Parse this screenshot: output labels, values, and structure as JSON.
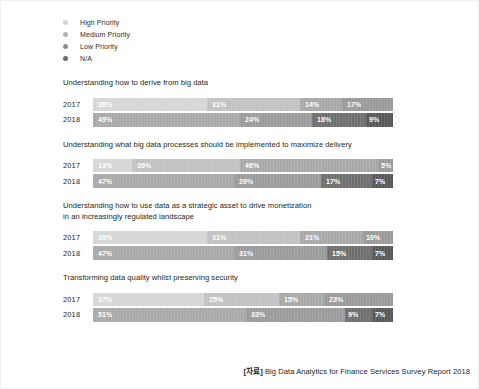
{
  "legend": {
    "items": [
      {
        "label": "High Priority",
        "color": "#d2d2d2",
        "icon": "legend-dot-icon"
      },
      {
        "label": "Medium Priority",
        "color": "#b4b4b4",
        "icon": "legend-dot-icon"
      },
      {
        "label": "Low Priority",
        "color": "#8e8e8e",
        "icon": "legend-dot-icon"
      },
      {
        "label": "N/A",
        "color": "#6b6b6b",
        "icon": "legend-dot-icon"
      }
    ]
  },
  "footer": {
    "source_tag": "[자료]",
    "text": "Big Data Analytics for Finance Services Survey Report 2018"
  },
  "chart_data": {
    "type": "bar",
    "orientation": "horizontal",
    "stacked": true,
    "units": "percent",
    "xlim": [
      0,
      100
    ],
    "grid": false,
    "legend_position": "top-left",
    "categories": [
      "High Priority",
      "Medium Priority",
      "Low Priority",
      "N/A"
    ],
    "series_colors_2017": [
      "#d6d6d6",
      "#c2c2c2",
      "#a8a8a8",
      "#9a9a9a"
    ],
    "series_colors_2018": [
      "#a9a9a9",
      "#9b9b9b",
      "#6e6e6e",
      "#585858"
    ],
    "charts": [
      {
        "title": "Understanding how to derive from big data",
        "rows": [
          {
            "year": "2017",
            "values": [
              38,
              31,
              14,
              17
            ],
            "labels": [
              "38%",
              "31%",
              "14%",
              "17%"
            ]
          },
          {
            "year": "2018",
            "values": [
              49,
              24,
              18,
              9
            ],
            "labels": [
              "49%",
              "24%",
              "18%",
              "9%"
            ]
          }
        ]
      },
      {
        "title": "Understanding what big data processes should be implemented to maximize delivery",
        "rows": [
          {
            "year": "2017",
            "values": [
              13,
              36,
              46,
              5
            ],
            "labels": [
              "13%",
              "36%",
              "46%",
              "5%"
            ]
          },
          {
            "year": "2018",
            "values": [
              47,
              29,
              17,
              7
            ],
            "labels": [
              "47%",
              "29%",
              "17%",
              "7%"
            ]
          }
        ]
      },
      {
        "title": "Understanding how to use data as a strategic asset to drive monetization\nin an increasingly regulated landscape",
        "rows": [
          {
            "year": "2017",
            "values": [
              38,
              31,
              21,
              10
            ],
            "labels": [
              "38%",
              "31%",
              "21%",
              "10%"
            ]
          },
          {
            "year": "2018",
            "values": [
              47,
              31,
              15,
              7
            ],
            "labels": [
              "47%",
              "31%",
              "15%",
              "7%"
            ]
          }
        ]
      },
      {
        "title": "Transforming data quality whilst preserving security",
        "rows": [
          {
            "year": "2017",
            "values": [
              37,
              25,
              15,
              23
            ],
            "labels": [
              "37%",
              "25%",
              "15%",
              "23%"
            ]
          },
          {
            "year": "2018",
            "values": [
              51,
              33,
              9,
              7
            ],
            "labels": [
              "51%",
              "33%",
              "9%",
              "7%"
            ]
          }
        ]
      }
    ]
  }
}
